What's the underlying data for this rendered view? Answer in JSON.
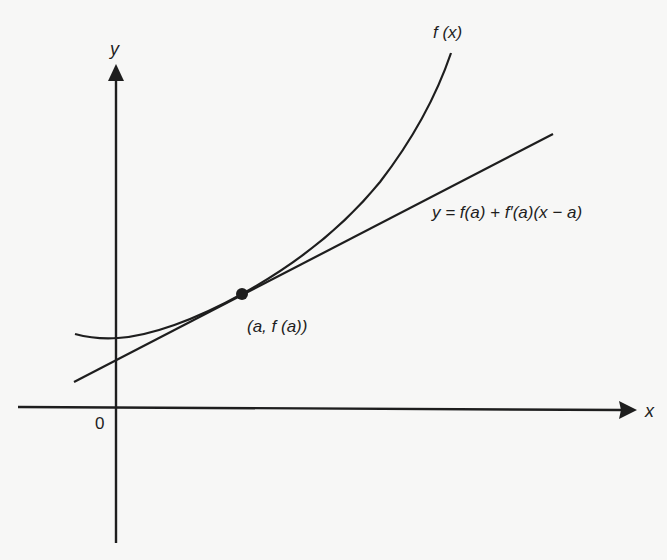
{
  "diagram": {
    "type": "tangent-line-illustration",
    "colors": {
      "background": "#f7f7f6",
      "ink": "#1e1e1e"
    },
    "axes": {
      "x_label": "x",
      "y_label": "y",
      "origin_label": "0"
    },
    "curve": {
      "label": "f (x)"
    },
    "tangent_line": {
      "label": "y = f(a) + f′(a)(x − a)"
    },
    "tangent_point": {
      "label": "(a, f (a))"
    }
  }
}
